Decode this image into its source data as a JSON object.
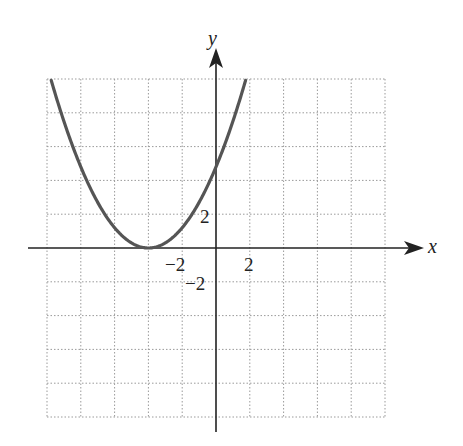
{
  "chart_data": {
    "type": "line",
    "title": "",
    "xlabel": "x",
    "ylabel": "y",
    "grid": true,
    "grid_step": 2,
    "xlim": [
      -10,
      10
    ],
    "ylim": [
      -10,
      10
    ],
    "x_tick_labels": [
      {
        "value": -2,
        "text": "−2"
      },
      {
        "value": 2,
        "text": "2"
      }
    ],
    "y_tick_labels": [
      {
        "value": 2,
        "text": "2"
      },
      {
        "value": -2,
        "text": "−2"
      }
    ],
    "series": [
      {
        "name": "parabola",
        "description": "upward-opening parabola with vertex on the x-axis",
        "vertex": [
          -4,
          0
        ],
        "y_intercept": 4.8,
        "x": [
          -10,
          -8,
          -6,
          -4,
          -2,
          0,
          2
        ],
        "y": [
          10,
          4.5,
          1.2,
          0,
          1.2,
          4.8,
          10
        ]
      }
    ],
    "colors": {
      "curve": "#555555",
      "axes": "#222222",
      "grid": "#9a9a9a"
    }
  },
  "labels": {
    "x_axis": "x",
    "y_axis": "y",
    "x_neg2": "−2",
    "x_pos2": "2",
    "y_pos2": "2",
    "y_neg2": "−2"
  }
}
